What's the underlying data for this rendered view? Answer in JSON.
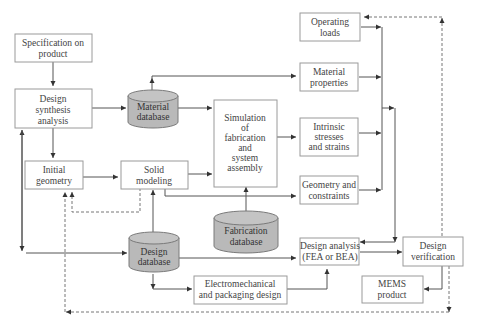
{
  "diagram": {
    "nodes": {
      "spec": {
        "lines": [
          "Specification on",
          "product"
        ]
      },
      "synthesis": {
        "lines": [
          "Design",
          "synthesis",
          "analysis"
        ]
      },
      "material_db": {
        "lines": [
          "Material",
          "database"
        ]
      },
      "initial_geometry": {
        "lines": [
          "Initial",
          "geometry"
        ]
      },
      "solid_modeling": {
        "lines": [
          "Solid",
          "modeling"
        ]
      },
      "simulation": {
        "lines": [
          "Simulation",
          "of",
          "fabrication",
          "and",
          "system",
          "assembly"
        ]
      },
      "fabrication_db": {
        "lines": [
          "Fabrication",
          "database"
        ]
      },
      "design_db": {
        "lines": [
          "Design",
          "database"
        ]
      },
      "operating_loads": {
        "lines": [
          "Operating",
          "loads"
        ]
      },
      "material_properties": {
        "lines": [
          "Material",
          "properties"
        ]
      },
      "intrinsic": {
        "lines": [
          "Intrinsic",
          "stresses",
          "and strains"
        ]
      },
      "geometry_constraints": {
        "lines": [
          "Geometry and",
          "constraints"
        ]
      },
      "design_analysis": {
        "lines": [
          "Design analysis",
          "(FEA or BEA)"
        ]
      },
      "design_verification": {
        "lines": [
          "Design",
          "verification"
        ]
      },
      "mems_product": {
        "lines": [
          "MEMS",
          "product"
        ]
      },
      "electromechanical": {
        "lines": [
          "Electromechanical",
          "and packaging design"
        ]
      }
    },
    "edges": [
      {
        "from": "spec",
        "to": "synthesis",
        "style": "solid"
      },
      {
        "from": "synthesis",
        "to": "material_db",
        "style": "solid"
      },
      {
        "from": "synthesis",
        "to": "initial_geometry",
        "style": "solid"
      },
      {
        "from": "material_db",
        "to": "material_properties",
        "style": "solid"
      },
      {
        "from": "material_db",
        "to": "simulation",
        "style": "solid"
      },
      {
        "from": "initial_geometry",
        "to": "solid_modeling",
        "style": "solid"
      },
      {
        "from": "solid_modeling",
        "to": "simulation",
        "style": "solid"
      },
      {
        "from": "solid_modeling",
        "to": "geometry_constraints",
        "style": "solid"
      },
      {
        "from": "solid_modeling",
        "to": "initial_geometry",
        "style": "dashed"
      },
      {
        "from": "simulation",
        "to": "intrinsic",
        "style": "solid"
      },
      {
        "from": "fabrication_db",
        "to": "simulation",
        "style": "solid"
      },
      {
        "from": "design_db",
        "to": "solid_modeling",
        "style": "solid"
      },
      {
        "from": "design_db",
        "to": "synthesis",
        "style": "solid"
      },
      {
        "from": "design_db",
        "to": "design_analysis",
        "style": "solid"
      },
      {
        "from": "design_db",
        "to": "electromechanical",
        "style": "solid"
      },
      {
        "from": "electromechanical",
        "to": "design_analysis",
        "style": "solid"
      },
      {
        "from": "operating_loads",
        "to": "design_analysis",
        "style": "solid"
      },
      {
        "from": "material_properties",
        "to": "design_analysis",
        "style": "solid"
      },
      {
        "from": "intrinsic",
        "to": "design_analysis",
        "style": "solid"
      },
      {
        "from": "geometry_constraints",
        "to": "design_analysis",
        "style": "solid"
      },
      {
        "from": "design_analysis",
        "to": "design_verification",
        "style": "solid"
      },
      {
        "from": "design_verification",
        "to": "mems_product",
        "style": "solid"
      },
      {
        "from": "design_verification",
        "to": "operating_loads",
        "style": "dashed"
      },
      {
        "from": "design_verification",
        "to": "initial_geometry",
        "style": "dashed"
      }
    ]
  }
}
